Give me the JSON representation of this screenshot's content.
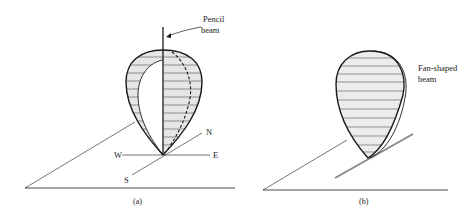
{
  "figure": {
    "panel_a": {
      "caption": "(a)",
      "beam_label_line1": "Pencil",
      "beam_label_line2": "beam",
      "compass": {
        "north": "N",
        "south": "S",
        "east": "E",
        "west": "W"
      }
    },
    "panel_b": {
      "caption": "(b)",
      "beam_label_line1": "Fan-shaped",
      "beam_label_line2": "beam"
    },
    "colors": {
      "line": "#1a1a1a",
      "fill": "#e6e6e6",
      "hatch": "#555555",
      "gray_line": "#888888"
    }
  }
}
